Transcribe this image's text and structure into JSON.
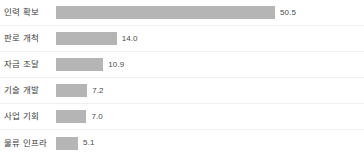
{
  "chart_data": {
    "type": "bar",
    "orientation": "horizontal",
    "title": "",
    "subtitle": "",
    "xlabel": "",
    "ylabel": "",
    "grid": false,
    "legend": null,
    "xlim": [
      0,
      50.5
    ],
    "categories": [
      "인력 확보",
      "판로 개척",
      "자금 조달",
      "기술 개발",
      "사업 기회",
      "물류 인프라"
    ],
    "values": [
      50.5,
      14.0,
      10.9,
      7.2,
      7.0,
      5.1
    ],
    "value_labels": [
      "50.5",
      "14.0",
      "10.9",
      "7.2",
      "7.0",
      "5.1"
    ],
    "bar_color": "#b5b5b5",
    "separator_color": "#efefef",
    "background_color": "#ffffff",
    "rows": [
      {
        "label": "인력 확보",
        "value": 50.5,
        "value_label": "50.5"
      },
      {
        "label": "판로 개척",
        "value": 14.0,
        "value_label": "14.0"
      },
      {
        "label": "자금 조달",
        "value": 10.9,
        "value_label": "10.9"
      },
      {
        "label": "기술 개발",
        "value": 7.2,
        "value_label": "7.2"
      },
      {
        "label": "사업 기회",
        "value": 7.0,
        "value_label": "7.0"
      },
      {
        "label": "물류 인프라",
        "value": 5.1,
        "value_label": "5.1"
      }
    ]
  }
}
